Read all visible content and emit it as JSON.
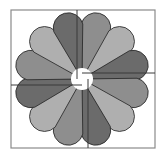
{
  "diagram": {
    "title": "",
    "type": "dresden-plate-quilt-block",
    "frame": {
      "x": 11,
      "y": 10,
      "width": 144,
      "height": 138,
      "stroke": "#8a8a8a"
    },
    "center": {
      "x": 82,
      "y": 79
    },
    "center_hole_radius": 11,
    "petal_count": 12,
    "petal_outer_radius": 68,
    "petal_half_width": 15,
    "petal_stroke": "#2a2a2a",
    "colors": {
      "dark": "#6b6b6b",
      "medium": "#8e8e8e",
      "light": "#afafaf"
    },
    "petals": [
      {
        "angle": 15,
        "shade": "medium"
      },
      {
        "angle": 45,
        "shade": "light"
      },
      {
        "angle": 75,
        "shade": "dark"
      },
      {
        "angle": 105,
        "shade": "medium"
      },
      {
        "angle": 135,
        "shade": "light"
      },
      {
        "angle": 165,
        "shade": "dark"
      },
      {
        "angle": 195,
        "shade": "medium"
      },
      {
        "angle": 225,
        "shade": "light"
      },
      {
        "angle": 255,
        "shade": "dark"
      },
      {
        "angle": 285,
        "shade": "medium"
      },
      {
        "angle": 315,
        "shade": "light"
      },
      {
        "angle": 345,
        "shade": "dark"
      }
    ],
    "dividers": [
      {
        "name": "top-divider",
        "x1": 77,
        "y1": 10,
        "x2": 77,
        "y2": 79
      },
      {
        "name": "right-divider",
        "x1": 82,
        "y1": 73,
        "x2": 155,
        "y2": 73
      },
      {
        "name": "bottom-divider",
        "x1": 88,
        "y1": 79,
        "x2": 88,
        "y2": 148
      },
      {
        "name": "left-divider",
        "x1": 11,
        "y1": 85,
        "x2": 82,
        "y2": 85
      }
    ],
    "divider_stroke": "#3a3a3a"
  }
}
